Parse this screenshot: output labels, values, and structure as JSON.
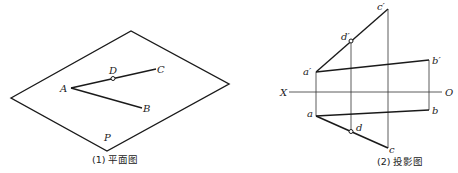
{
  "figure1": {
    "caption": "(1) 平面图",
    "plane_label": "P",
    "points": {
      "A": "A",
      "B": "B",
      "C": "C",
      "D": "D"
    }
  },
  "figure2": {
    "caption": "(2) 投影图",
    "axis": {
      "left": "X",
      "right": "O"
    },
    "points": {
      "a_prime": "a′",
      "b_prime": "b′",
      "c_prime": "c′",
      "d_prime": "d′",
      "a": "a",
      "b": "b",
      "c": "c",
      "d": "d"
    }
  }
}
